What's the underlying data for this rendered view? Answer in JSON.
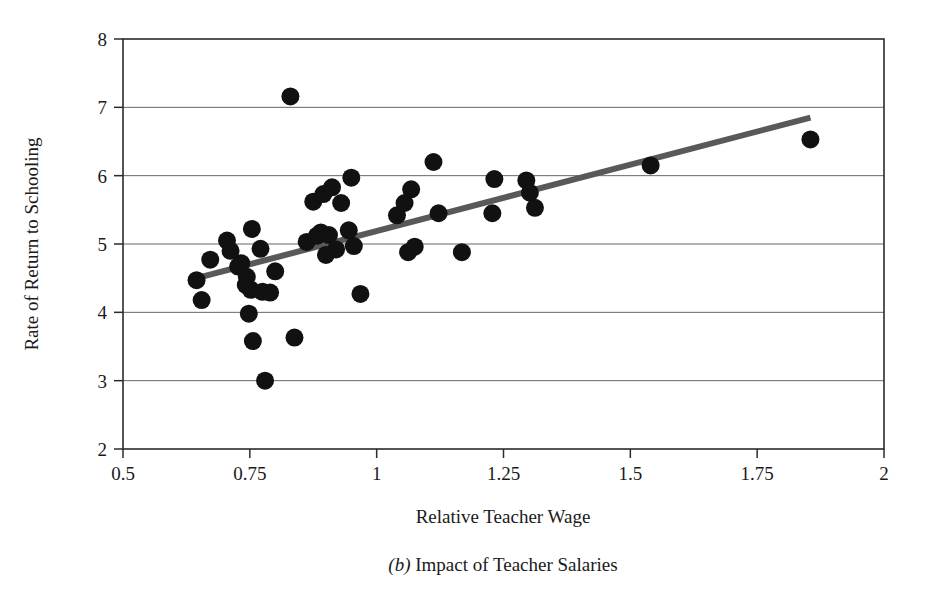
{
  "figure": {
    "caption_prefix": "(b)",
    "caption_text": " Impact of Teacher Salaries"
  },
  "chart_data": {
    "type": "scatter",
    "title": "",
    "xlabel": "Relative Teacher Wage",
    "ylabel": "Rate of Return to Schooling",
    "xlim": [
      0.5,
      2
    ],
    "ylim": [
      2,
      8
    ],
    "xticks": [
      0.5,
      0.75,
      1,
      1.25,
      1.5,
      1.75,
      2
    ],
    "xtick_labels": [
      "0.5",
      "0.75",
      "1",
      "1.25",
      "1.5",
      "1.75",
      "2"
    ],
    "yticks": [
      2,
      3,
      4,
      5,
      6,
      7,
      8
    ],
    "ytick_labels": [
      "2",
      "3",
      "4",
      "5",
      "6",
      "7",
      "8"
    ],
    "grid": "horizontal",
    "legend": "none",
    "marker": "filled-circle",
    "marker_color": "#111111",
    "marker_radius_px": 9,
    "trendline": {
      "type": "linear-fit",
      "color": "#595959",
      "width_px": 6,
      "x_start": 0.645,
      "y_start": 4.5,
      "x_end": 1.855,
      "y_end": 6.85
    },
    "points": [
      {
        "x": 0.645,
        "y": 4.47
      },
      {
        "x": 0.655,
        "y": 4.18
      },
      {
        "x": 0.672,
        "y": 4.77
      },
      {
        "x": 0.705,
        "y": 5.05
      },
      {
        "x": 0.712,
        "y": 4.9
      },
      {
        "x": 0.727,
        "y": 4.67
      },
      {
        "x": 0.733,
        "y": 4.72
      },
      {
        "x": 0.742,
        "y": 4.4
      },
      {
        "x": 0.744,
        "y": 4.52
      },
      {
        "x": 0.748,
        "y": 3.98
      },
      {
        "x": 0.752,
        "y": 4.33
      },
      {
        "x": 0.754,
        "y": 5.22
      },
      {
        "x": 0.756,
        "y": 3.58
      },
      {
        "x": 0.771,
        "y": 4.93
      },
      {
        "x": 0.775,
        "y": 4.3
      },
      {
        "x": 0.78,
        "y": 3.0
      },
      {
        "x": 0.79,
        "y": 4.29
      },
      {
        "x": 0.8,
        "y": 4.6
      },
      {
        "x": 0.83,
        "y": 7.16
      },
      {
        "x": 0.838,
        "y": 3.63
      },
      {
        "x": 0.862,
        "y": 5.03
      },
      {
        "x": 0.875,
        "y": 5.62
      },
      {
        "x": 0.882,
        "y": 5.12
      },
      {
        "x": 0.89,
        "y": 5.17
      },
      {
        "x": 0.895,
        "y": 5.73
      },
      {
        "x": 0.9,
        "y": 4.84
      },
      {
        "x": 0.906,
        "y": 5.13
      },
      {
        "x": 0.912,
        "y": 5.83
      },
      {
        "x": 0.92,
        "y": 4.92
      },
      {
        "x": 0.93,
        "y": 5.6
      },
      {
        "x": 0.945,
        "y": 5.2
      },
      {
        "x": 0.95,
        "y": 5.97
      },
      {
        "x": 0.955,
        "y": 4.97
      },
      {
        "x": 0.968,
        "y": 4.27
      },
      {
        "x": 1.04,
        "y": 5.42
      },
      {
        "x": 1.055,
        "y": 5.6
      },
      {
        "x": 1.062,
        "y": 4.88
      },
      {
        "x": 1.068,
        "y": 5.8
      },
      {
        "x": 1.075,
        "y": 4.96
      },
      {
        "x": 1.112,
        "y": 6.2
      },
      {
        "x": 1.122,
        "y": 5.45
      },
      {
        "x": 1.168,
        "y": 4.88
      },
      {
        "x": 1.228,
        "y": 5.45
      },
      {
        "x": 1.232,
        "y": 5.95
      },
      {
        "x": 1.295,
        "y": 5.93
      },
      {
        "x": 1.302,
        "y": 5.75
      },
      {
        "x": 1.312,
        "y": 5.53
      },
      {
        "x": 1.54,
        "y": 6.15
      },
      {
        "x": 1.855,
        "y": 6.53
      }
    ]
  }
}
